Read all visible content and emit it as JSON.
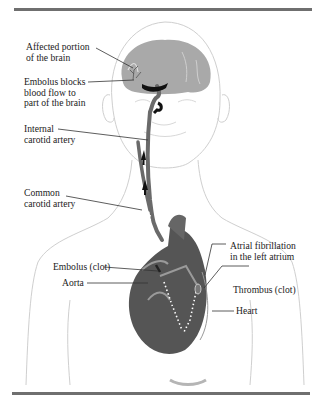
{
  "figure": {
    "labels": {
      "affected_brain": "Affected portion\nof the brain",
      "embolus_blocks": "Embolus blocks\nblood flow to\npart of the brain",
      "internal_carotid": "Internal\ncarotid artery",
      "common_carotid": "Common\ncarotid artery",
      "atrial_fibrillation": "Atrial fibrillation\nin the left atrium",
      "embolus_clot": "Embolus (clot)",
      "thrombus_clot": "Thrombus (clot)",
      "aorta": "Aorta",
      "heart": "Heart"
    },
    "colors": {
      "rule": "#6f6f6f",
      "brain": "#a9a9a9",
      "artery": "#6a6a6a",
      "heart": "#555555",
      "clot": "#111111",
      "outline": "#c8c8c8",
      "leader": "#333333"
    }
  }
}
